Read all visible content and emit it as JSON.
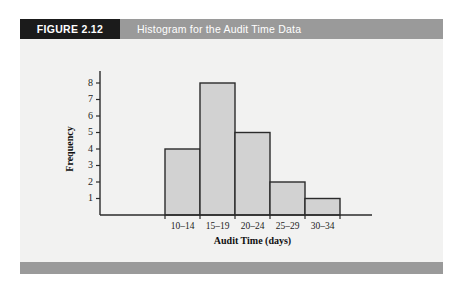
{
  "figure": {
    "tag_label": "FIGURE 2.12",
    "title": "Histogram for the Audit Time Data"
  },
  "colors": {
    "header_bar": "#9a9a9a",
    "tag_block": "#1b1b1b",
    "panel_background": "#f2f2f1",
    "bar_fill": "#d2d2d2",
    "axis": "#2b2b2b",
    "title_text": "#ffffff"
  },
  "chart_data": {
    "type": "bar",
    "title": "Histogram for the Audit Time Data",
    "xlabel": "Audit Time (days)",
    "ylabel": "Frequency",
    "categories": [
      "10–14",
      "15–19",
      "20–24",
      "25–29",
      "30–34"
    ],
    "values": [
      4,
      8,
      5,
      2,
      1
    ],
    "ylim": [
      0,
      8
    ],
    "yticks": [
      1,
      2,
      3,
      4,
      5,
      6,
      7,
      8
    ],
    "ytick_labels": [
      "1",
      "2",
      "3",
      "4",
      "5",
      "6",
      "7",
      "8"
    ],
    "grid": false,
    "legend": null
  }
}
